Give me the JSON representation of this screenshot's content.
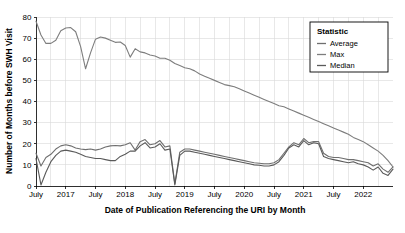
{
  "chart_data": {
    "type": "line",
    "title": "",
    "xlabel": "Date of Publication Referencing the URI by Month",
    "ylabel": "Number of Months before SWH Visit",
    "ylim": [
      0,
      80
    ],
    "yticks": [
      0,
      10,
      20,
      30,
      40,
      50,
      60,
      70,
      80
    ],
    "grid": true,
    "legend": {
      "title": "Statistic",
      "position": "top-right",
      "entries": [
        {
          "label": "Average",
          "color": "#6f6f6f"
        },
        {
          "label": "Max",
          "color": "#7d7d7d"
        },
        {
          "label": "Median",
          "color": "#5a5a5a"
        }
      ]
    },
    "xticks": [
      {
        "index": 0,
        "label": "July"
      },
      {
        "index": 6,
        "label": "2017"
      },
      {
        "index": 12,
        "label": "July"
      },
      {
        "index": 18,
        "label": "2018"
      },
      {
        "index": 24,
        "label": "July"
      },
      {
        "index": 30,
        "label": "2019"
      },
      {
        "index": 36,
        "label": "July"
      },
      {
        "index": 42,
        "label": "2020"
      },
      {
        "index": 48,
        "label": "July"
      },
      {
        "index": 54,
        "label": "2021"
      },
      {
        "index": 60,
        "label": "July"
      },
      {
        "index": 66,
        "label": "2022"
      }
    ],
    "x": [
      "2016-07",
      "2016-08",
      "2016-09",
      "2016-10",
      "2016-11",
      "2016-12",
      "2017-01",
      "2017-02",
      "2017-03",
      "2017-04",
      "2017-05",
      "2017-06",
      "2017-07",
      "2017-08",
      "2017-09",
      "2017-10",
      "2017-11",
      "2017-12",
      "2018-01",
      "2018-02",
      "2018-03",
      "2018-04",
      "2018-05",
      "2018-06",
      "2018-07",
      "2018-08",
      "2018-09",
      "2018-10",
      "2018-11",
      "2018-12",
      "2019-01",
      "2019-02",
      "2019-03",
      "2019-04",
      "2019-05",
      "2019-06",
      "2019-07",
      "2019-08",
      "2019-09",
      "2019-10",
      "2019-11",
      "2019-12",
      "2020-01",
      "2020-02",
      "2020-03",
      "2020-04",
      "2020-05",
      "2020-06",
      "2020-07",
      "2020-08",
      "2020-09",
      "2020-10",
      "2020-11",
      "2020-12",
      "2021-01",
      "2021-02",
      "2021-03",
      "2021-04",
      "2021-05",
      "2021-06",
      "2021-07",
      "2021-08",
      "2021-09",
      "2021-10",
      "2021-11",
      "2021-12",
      "2022-01",
      "2022-02",
      "2022-03",
      "2022-04",
      "2022-05",
      "2022-06",
      "2022-07"
    ],
    "series": [
      {
        "name": "Max",
        "color": "#7d7d7d",
        "values": [
          78.0,
          71.5,
          67.5,
          67.5,
          69.0,
          73.5,
          74.8,
          75.0,
          73.0,
          66.0,
          55.5,
          63.0,
          69.5,
          70.5,
          70.0,
          69.0,
          68.0,
          68.2,
          66.5,
          61.0,
          65.0,
          63.5,
          63.0,
          62.0,
          61.5,
          60.5,
          60.5,
          59.5,
          58.0,
          57.0,
          56.0,
          55.5,
          54.5,
          53.0,
          52.0,
          51.0,
          50.0,
          49.0,
          48.0,
          47.5,
          47.0,
          46.0,
          45.0,
          44.0,
          43.0,
          42.0,
          41.0,
          40.0,
          39.0,
          38.0,
          37.5,
          36.5,
          35.5,
          34.5,
          33.5,
          32.5,
          31.5,
          30.5,
          29.5,
          28.5,
          27.5,
          26.5,
          25.5,
          24.5,
          23.0,
          22.0,
          21.0,
          19.5,
          18.0,
          16.5,
          14.5,
          12.0,
          9.0
        ]
      },
      {
        "name": "Average",
        "color": "#6f6f6f",
        "values": [
          15.5,
          9.5,
          13.5,
          15.0,
          17.5,
          19.0,
          19.5,
          19.0,
          18.0,
          17.5,
          17.2,
          17.5,
          17.0,
          17.5,
          18.5,
          19.0,
          19.2,
          19.0,
          19.5,
          20.5,
          17.0,
          21.0,
          22.0,
          19.5,
          20.0,
          21.5,
          18.5,
          19.0,
          1.0,
          16.0,
          17.5,
          17.5,
          17.0,
          16.5,
          16.0,
          15.5,
          15.0,
          14.5,
          14.0,
          13.5,
          13.0,
          12.5,
          12.0,
          11.5,
          11.0,
          10.8,
          10.5,
          10.5,
          11.0,
          12.5,
          15.5,
          18.5,
          20.5,
          19.5,
          22.5,
          20.5,
          21.0,
          21.0,
          15.5,
          14.0,
          13.5,
          13.5,
          13.0,
          12.5,
          12.5,
          12.0,
          11.5,
          11.0,
          9.5,
          10.5,
          8.0,
          6.5,
          9.0
        ]
      },
      {
        "name": "Median",
        "color": "#5a5a5a",
        "values": [
          13.0,
          0.5,
          6.5,
          11.5,
          14.5,
          16.5,
          17.0,
          16.5,
          16.0,
          15.0,
          14.0,
          13.5,
          13.0,
          13.0,
          12.5,
          12.0,
          12.0,
          14.0,
          15.0,
          16.5,
          16.5,
          19.0,
          20.5,
          18.0,
          18.5,
          20.0,
          17.0,
          17.5,
          0.5,
          14.5,
          16.5,
          16.5,
          16.0,
          15.5,
          15.0,
          14.5,
          14.0,
          13.5,
          13.0,
          12.5,
          12.0,
          11.5,
          11.0,
          10.5,
          10.0,
          9.8,
          9.5,
          9.5,
          10.0,
          11.5,
          14.5,
          18.0,
          19.5,
          18.5,
          21.5,
          19.5,
          20.5,
          20.0,
          14.0,
          13.0,
          12.5,
          12.0,
          11.5,
          11.0,
          11.5,
          10.5,
          10.0,
          9.0,
          7.5,
          9.0,
          6.0,
          5.0,
          8.0
        ]
      }
    ]
  }
}
